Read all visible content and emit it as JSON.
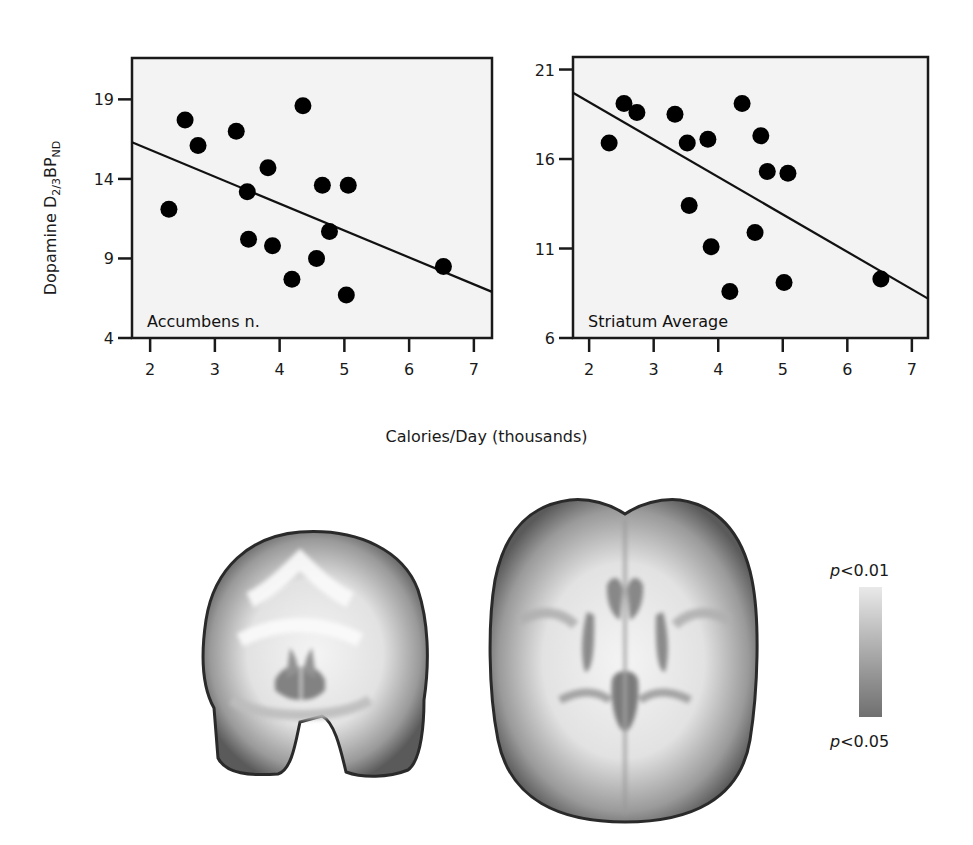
{
  "figure": {
    "shared_xlabel": "Calories/Day (thousands)",
    "ylabel_main": "Dopamine D",
    "ylabel_sub": "2/3",
    "ylabel_mid": "BP",
    "ylabel_sub2": "ND",
    "legend": {
      "top_label_p": "p",
      "top_label_rest": "<0.01",
      "bottom_label_p": "p",
      "bottom_label_rest": "<0.05"
    },
    "brain_images": [
      "coronal-slice",
      "axial-slice"
    ]
  },
  "chart_data": [
    {
      "type": "scatter",
      "title": "Accumbens n.",
      "xlabel": "Calories/Day (thousands)",
      "ylabel": "Dopamine D2/3 BPND",
      "xlim": [
        1.72,
        7.28
      ],
      "ylim": [
        4,
        21.6
      ],
      "xticks": [
        2,
        3,
        4,
        5,
        6,
        7
      ],
      "yticks": [
        4,
        9,
        14,
        19
      ],
      "grid": false,
      "x": [
        2.29,
        2.54,
        2.74,
        3.33,
        3.5,
        3.52,
        3.82,
        3.89,
        4.19,
        4.36,
        4.57,
        4.66,
        4.77,
        5.03,
        5.06,
        6.53
      ],
      "y": [
        12.1,
        17.7,
        16.1,
        17.0,
        13.2,
        10.2,
        14.7,
        9.8,
        7.7,
        18.6,
        9.0,
        13.6,
        10.7,
        6.7,
        13.6,
        8.5
      ],
      "fit_line": {
        "x": [
          1.72,
          7.28
        ],
        "y": [
          16.3,
          6.9
        ]
      }
    },
    {
      "type": "scatter",
      "title": "Striatum Average",
      "xlabel": "Calories/Day (thousands)",
      "ylabel": "",
      "xlim": [
        1.75,
        7.25
      ],
      "ylim": [
        6,
        21.7
      ],
      "xticks": [
        2,
        3,
        4,
        5,
        6,
        7
      ],
      "yticks": [
        6,
        11,
        16,
        21
      ],
      "grid": false,
      "x": [
        2.31,
        2.54,
        2.74,
        3.33,
        3.52,
        3.55,
        3.84,
        3.89,
        4.18,
        4.37,
        4.57,
        4.66,
        4.76,
        5.02,
        5.08,
        6.52
      ],
      "y": [
        16.9,
        19.1,
        18.6,
        18.5,
        16.9,
        13.4,
        17.1,
        11.1,
        8.6,
        19.1,
        11.9,
        17.3,
        15.3,
        9.1,
        15.2,
        9.3
      ],
      "fit_line": {
        "x": [
          1.75,
          7.25
        ],
        "y": [
          19.7,
          8.2
        ]
      }
    }
  ]
}
